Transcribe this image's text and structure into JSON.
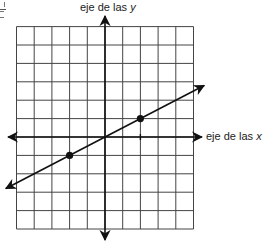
{
  "chart_data": {
    "type": "line",
    "title": "",
    "xlabel": "eje de las x",
    "ylabel": "eje de las y",
    "xlim": [
      -5,
      5
    ],
    "ylim": [
      -5,
      6
    ],
    "grid": true,
    "legend": null,
    "series": [
      {
        "name": "line",
        "equation": "y = x/2",
        "slope": 0.5,
        "intercept": 0,
        "arrows_both_ends": true,
        "x": [
          -5.6,
          5.6
        ],
        "y": [
          -2.8,
          2.8
        ]
      }
    ],
    "points": [
      {
        "x": -2,
        "y": -1
      },
      {
        "x": 2,
        "y": 1
      }
    ],
    "annotations": [
      {
        "type": "tick",
        "x": 2,
        "y": 0
      }
    ]
  },
  "labels": {
    "y_axis_prefix": "eje de las ",
    "y_axis_var": "y",
    "x_axis_prefix": "eje de las ",
    "x_axis_var": "x"
  },
  "layout": {
    "origin_px": [
      105,
      137
    ],
    "cell_w": 17.7,
    "cell_h": 18.4,
    "grid_color": "#444444",
    "axis_color": "#111111",
    "line_color": "#111111"
  }
}
